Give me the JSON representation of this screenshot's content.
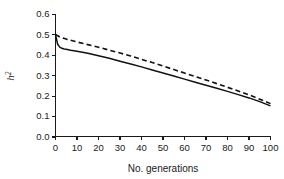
{
  "chart_data": {
    "type": "line",
    "title": "",
    "subtitle": "",
    "xlabel": "No. generations",
    "ylabel": "h2",
    "ylabel_display": "h²",
    "xlim": [
      0,
      100
    ],
    "ylim": [
      0.0,
      0.6
    ],
    "grid": false,
    "legend": "none",
    "x_ticks": [
      0,
      10,
      20,
      30,
      40,
      50,
      60,
      70,
      80,
      90,
      100
    ],
    "x_tick_labels": [
      "0",
      "10",
      "20",
      "30",
      "40",
      "50",
      "60",
      "70",
      "80",
      "90",
      "100"
    ],
    "y_ticks": [
      0.0,
      0.1,
      0.2,
      0.3,
      0.4,
      0.5,
      0.6
    ],
    "y_tick_labels": [
      "0.0",
      "0.1",
      "0.2",
      "0.3",
      "0.4",
      "0.5",
      "0.6"
    ],
    "line_color": "#111111",
    "series": [
      {
        "name": "solid",
        "style": "solid",
        "color": "#111111",
        "x": [
          0,
          1,
          2,
          3,
          4,
          5,
          7,
          10,
          15,
          20,
          25,
          30,
          35,
          40,
          45,
          50,
          55,
          60,
          65,
          70,
          75,
          80,
          85,
          90,
          95,
          100
        ],
        "values": [
          0.5,
          0.452,
          0.438,
          0.432,
          0.429,
          0.427,
          0.423,
          0.418,
          0.408,
          0.396,
          0.383,
          0.369,
          0.355,
          0.341,
          0.326,
          0.311,
          0.296,
          0.281,
          0.266,
          0.251,
          0.236,
          0.221,
          0.205,
          0.189,
          0.171,
          0.15
        ]
      },
      {
        "name": "dashed",
        "style": "dashed",
        "color": "#111111",
        "x": [
          0,
          2,
          5,
          10,
          15,
          20,
          25,
          30,
          35,
          40,
          45,
          50,
          55,
          60,
          65,
          70,
          75,
          80,
          85,
          90,
          95,
          100
        ],
        "values": [
          0.5,
          0.487,
          0.477,
          0.463,
          0.45,
          0.437,
          0.423,
          0.409,
          0.394,
          0.378,
          0.362,
          0.345,
          0.328,
          0.311,
          0.294,
          0.277,
          0.259,
          0.241,
          0.223,
          0.204,
          0.183,
          0.161
        ]
      }
    ]
  }
}
